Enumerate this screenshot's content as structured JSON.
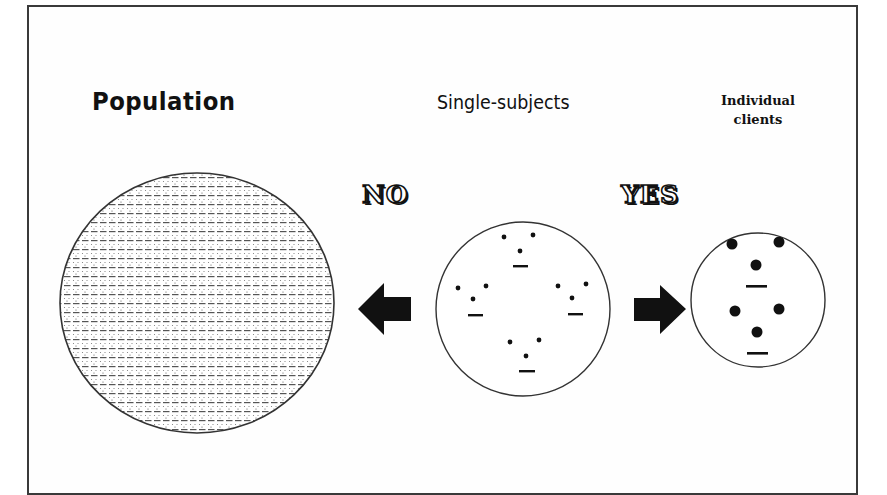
{
  "figure": {
    "labels": {
      "population": "Population",
      "single_subjects": "Single-subjects",
      "individual_clients_line1": "Individual",
      "individual_clients_line2": "clients"
    },
    "arrows": {
      "left_answer": "NO",
      "right_answer": "YES"
    },
    "icons": {
      "left_arrow": "arrow-left-icon",
      "right_arrow": "arrow-right-icon"
    },
    "colors": {
      "ink": "#111111",
      "frame": "#3a3a3a",
      "background": "#ffffff"
    },
    "groups": {
      "single_subjects": {
        "clusters": 4,
        "dots_per_cluster": 3,
        "style": "small dots with underline"
      },
      "individual_clients": {
        "clusters": 2,
        "dots_per_cluster": 3,
        "style": "large dots with underline"
      }
    }
  }
}
